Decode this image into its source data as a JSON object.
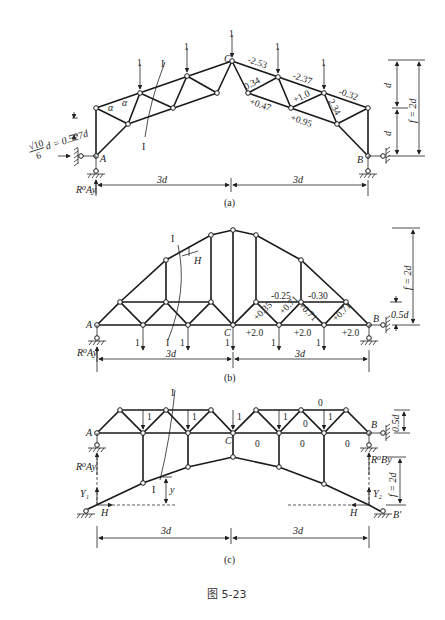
{
  "figure": {
    "caption": "图 5-23",
    "subfigures": [
      {
        "id": "a",
        "label": "(a)",
        "nodes": {
          "A": "A",
          "B": "B",
          "C": "C"
        },
        "support_reaction": "R⁰Ay",
        "loads": [
          "1",
          "1",
          "1",
          "1",
          "1"
        ],
        "section_label": "I",
        "angle_label": "α",
        "offset_dim": "√10/6 d = 0.527d",
        "offset_numer": "√10",
        "offset_denom": "6",
        "offset_rest": "d = 0.527d",
        "member_forces": {
          "top_1": "-2.53",
          "top_2": "-2.37",
          "top_3": "-0.32",
          "diag_1": "0.34",
          "diag_2": "+1.0",
          "diag_3": "2.34",
          "bottom_1": "+0.47",
          "bottom_2": "+0.95"
        },
        "dims": {
          "half_span_left": "3d",
          "half_span_right": "3d",
          "d_upper": "d",
          "d_lower": "d",
          "rise": "f = 2d"
        }
      },
      {
        "id": "b",
        "label": "(b)",
        "nodes": {
          "A": "A",
          "B": "B",
          "C": "C"
        },
        "support_reaction": "R⁰Ay",
        "loads": [
          "1",
          "1",
          "1",
          "1",
          "1"
        ],
        "section_label": "I",
        "section_label_2": "I",
        "thrust_label": "H",
        "member_forces": {
          "upper_1": "-0.25",
          "upper_2": "-0.30",
          "diag_1": "+0.35",
          "diag_2": "+0.71",
          "diag_3": "+0.71",
          "diag_4": "+0.71",
          "bottom_1": "+2.0",
          "bottom_2": "+2.0",
          "bottom_3": "+2.0"
        },
        "dims": {
          "half_span_left": "3d",
          "half_span_right": "3d",
          "rise": "f = 2d",
          "panel_height": "0.5d"
        }
      },
      {
        "id": "c",
        "label": "(c)",
        "nodes": {
          "A": "A",
          "B": "B",
          "C": "C",
          "B_prime": "B'"
        },
        "reactions": {
          "left_R": "R⁰Ay",
          "right_R": "R⁰By",
          "Y_left": "Y₁",
          "Y_right": "Y₂",
          "H_left": "H",
          "H_right": "H"
        },
        "loads": [
          "1",
          "1",
          "1",
          "1",
          "1"
        ],
        "section_label": "I",
        "section_label_2": "I",
        "y_label": "y",
        "zero_forces": [
          "0",
          "0",
          "0",
          "0",
          "0"
        ],
        "dims": {
          "half_span_left": "3d",
          "half_span_right": "3d",
          "rise": "f = 2d",
          "panel_height": "0.5d"
        }
      }
    ]
  }
}
